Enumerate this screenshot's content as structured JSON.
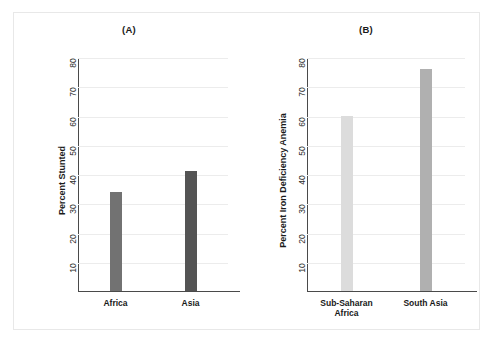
{
  "figure": {
    "background_color": "#ffffff",
    "frame_color": "#e8e8e8",
    "gridline_color": "#ececec",
    "axis_color": "#4a4a4a"
  },
  "panels": [
    {
      "id": "a",
      "title": "(A)",
      "ylabel": "Percent Stunted",
      "ticks": [
        "80",
        "70",
        "60",
        "50",
        "40",
        "30",
        "20",
        "10"
      ],
      "bars": [
        {
          "label": "Africa",
          "value": 34,
          "color": "#727272"
        },
        {
          "label": "Asia",
          "value": 41,
          "color": "#545454"
        }
      ]
    },
    {
      "id": "b",
      "title": "(B)",
      "ylabel": "Percent Iron Deficiency Anemia",
      "ticks": [
        "80",
        "70",
        "60",
        "50",
        "40",
        "30",
        "20",
        "10"
      ],
      "bars": [
        {
          "label": "Sub-Saharan\nAfrica",
          "value": 60,
          "color": "#dcdcdc"
        },
        {
          "label": "South Asia",
          "value": 76,
          "color": "#b0b0b0"
        }
      ]
    }
  ],
  "chart_data": [
    {
      "type": "bar",
      "title": "(A)",
      "categories": [
        "Africa",
        "Asia"
      ],
      "values": [
        34,
        41
      ],
      "xlabel": "",
      "ylabel": "Percent Stunted",
      "ylim": [
        0,
        80
      ],
      "yticks": [
        10,
        20,
        30,
        40,
        50,
        60,
        70,
        80
      ],
      "grid": true,
      "legend": "none",
      "bar_colors": [
        "#727272",
        "#545454"
      ]
    },
    {
      "type": "bar",
      "title": "(B)",
      "categories": [
        "Sub-Saharan Africa",
        "South Asia"
      ],
      "values": [
        60,
        76
      ],
      "xlabel": "",
      "ylabel": "Percent Iron Deficiency Anemia",
      "ylim": [
        0,
        80
      ],
      "yticks": [
        10,
        20,
        30,
        40,
        50,
        60,
        70,
        80
      ],
      "grid": true,
      "legend": "none",
      "bar_colors": [
        "#dcdcdc",
        "#b0b0b0"
      ]
    }
  ]
}
